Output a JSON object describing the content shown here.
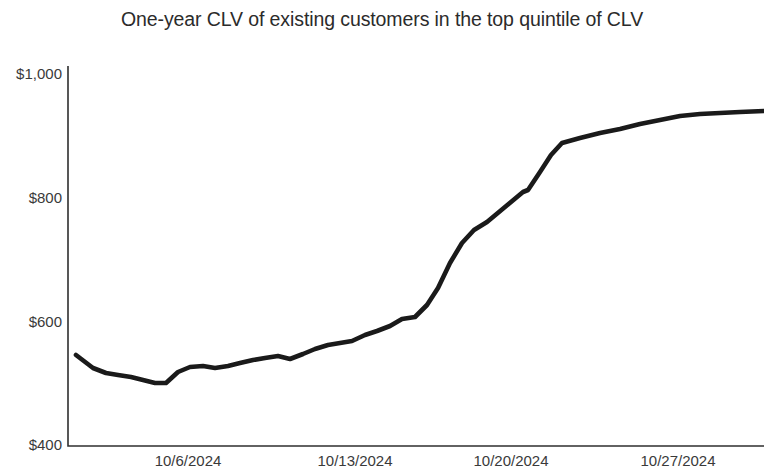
{
  "chart_data": {
    "type": "line",
    "title": "One-year CLV of existing customers in the top quintile of CLV",
    "xlabel": "",
    "ylabel": "",
    "grid": false,
    "legend": false,
    "legend_position": "none",
    "line_color": "#1a1a1a",
    "background_color": "#ffffff",
    "axis_color": "#2f2f2f",
    "ylim": [
      400,
      1000
    ],
    "y_tick_labels": [
      "$1,000",
      "$800",
      "$600",
      "$400"
    ],
    "y_ticks": [
      1000,
      800,
      600,
      400
    ],
    "x_tick_labels": [
      "10/6/2024",
      "10/13/2024",
      "10/20/2024",
      "10/27/2024"
    ],
    "x_ticks": [
      "2024-10-06",
      "2024-10-13",
      "2024-10-20",
      "2024-10-27"
    ],
    "xlim": [
      "2024-10-01",
      "2024-10-31"
    ],
    "x": [
      "2024-10-01",
      "2024-10-02",
      "2024-10-03",
      "2024-10-04",
      "2024-10-05",
      "2024-10-06",
      "2024-10-07",
      "2024-10-08",
      "2024-10-09",
      "2024-10-10",
      "2024-10-11",
      "2024-10-12",
      "2024-10-13",
      "2024-10-14",
      "2024-10-15",
      "2024-10-16",
      "2024-10-17",
      "2024-10-18",
      "2024-10-19",
      "2024-10-20",
      "2024-10-21",
      "2024-10-22",
      "2024-10-23",
      "2024-10-24",
      "2024-10-25",
      "2024-10-26",
      "2024-10-27",
      "2024-10-28",
      "2024-10-29",
      "2024-10-30",
      "2024-10-31"
    ],
    "values": [
      546,
      533,
      526,
      524,
      521,
      517,
      512,
      506,
      519,
      524,
      525,
      522,
      525,
      530,
      536,
      540,
      543,
      540,
      549,
      558,
      566,
      570,
      574,
      585,
      594,
      604,
      617,
      622,
      645,
      676,
      722
    ],
    "series": [
      {
        "name": "One-year CLV",
        "values": [
          546,
          533,
          526,
          524,
          521,
          517,
          512,
          506,
          519,
          524,
          525,
          522,
          525,
          530,
          536,
          540,
          543,
          540,
          549,
          558,
          566,
          570,
          574,
          585,
          594,
          604,
          617,
          622,
          645,
          676,
          722
        ]
      }
    ],
    "points_px": [
      [
        76,
        355
      ],
      [
        93,
        368
      ],
      [
        106,
        373
      ],
      [
        118,
        375
      ],
      [
        131,
        377
      ],
      [
        143,
        380
      ],
      [
        155,
        383
      ],
      [
        166,
        383
      ],
      [
        178,
        372
      ],
      [
        190,
        367
      ],
      [
        203,
        366
      ],
      [
        215,
        368
      ],
      [
        228,
        366
      ],
      [
        240,
        363
      ],
      [
        253,
        360
      ],
      [
        265,
        358
      ],
      [
        278,
        356
      ],
      [
        290,
        359
      ],
      [
        303,
        354
      ],
      [
        315,
        349
      ],
      [
        328,
        345
      ],
      [
        340,
        343
      ],
      [
        352,
        341
      ],
      [
        365,
        335
      ],
      [
        377,
        331
      ],
      [
        390,
        326
      ],
      [
        402,
        319
      ],
      [
        415,
        317
      ],
      [
        427,
        305
      ],
      [
        438,
        288
      ],
      [
        450,
        263
      ],
      [
        462,
        243
      ],
      [
        474,
        230
      ],
      [
        487,
        222
      ],
      [
        499,
        212
      ],
      [
        511,
        202
      ],
      [
        523,
        192
      ],
      [
        528,
        190
      ],
      [
        540,
        172
      ],
      [
        551,
        155
      ],
      [
        562,
        143
      ],
      [
        580,
        138
      ],
      [
        600,
        133
      ],
      [
        620,
        129
      ],
      [
        640,
        124
      ],
      [
        660,
        120
      ],
      [
        680,
        116
      ],
      [
        700,
        114
      ],
      [
        720,
        113
      ],
      [
        740,
        112
      ],
      [
        764,
        111
      ]
    ],
    "annotations": [],
    "summary": {
      "start_value": 546,
      "min_value": 506,
      "max_value": 940,
      "end_value": 940,
      "trend": "flat then sharp rise, plateau"
    }
  },
  "axis": {
    "y_labels": [
      {
        "text": "$1,000",
        "top_px": 65
      },
      {
        "text": "$800",
        "top_px": 189
      },
      {
        "text": "$600",
        "top_px": 313
      },
      {
        "text": "$400",
        "top_px": 436
      }
    ],
    "x_labels": [
      {
        "text": "10/6/2024",
        "left_px": 188
      },
      {
        "text": "10/13/2024",
        "left_px": 355
      },
      {
        "text": "10/20/2024",
        "left_px": 511
      },
      {
        "text": "10/27/2024",
        "left_px": 678
      }
    ]
  }
}
